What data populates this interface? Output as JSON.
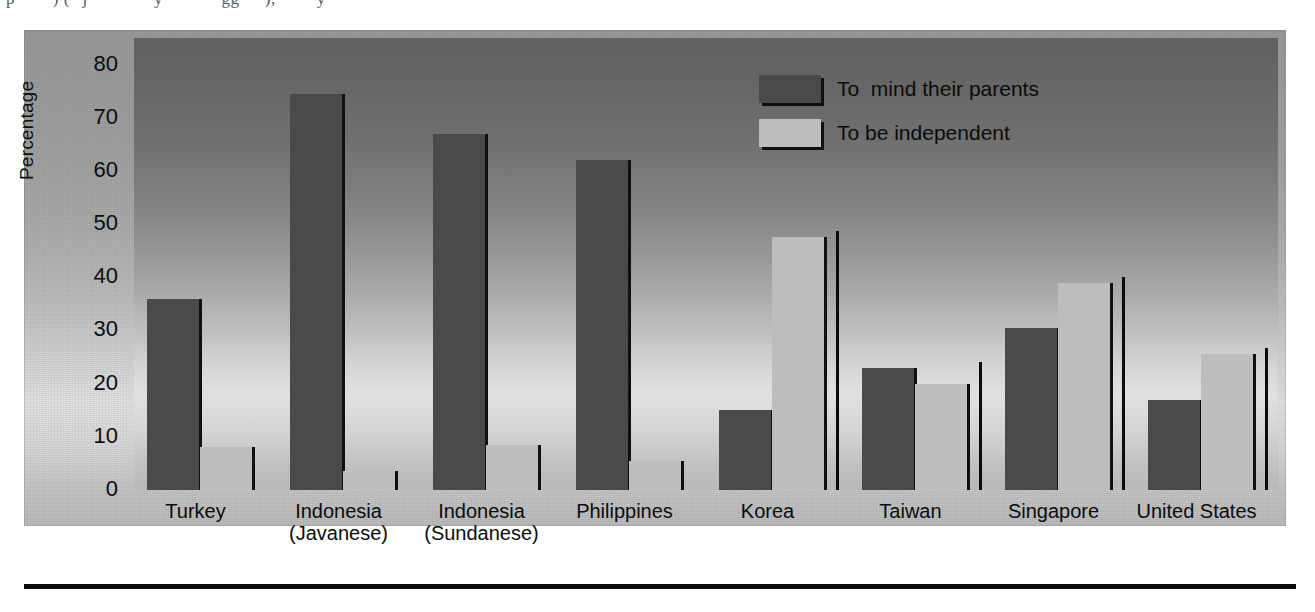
{
  "page": {
    "top_text_fragment": "p······) (··j·····  ···  ·y ···  ··· ·gg····),  ·· ···y",
    "bottom_rule": "horizontal-rule"
  },
  "chart_data": {
    "type": "bar",
    "title": "",
    "xlabel": "",
    "ylabel": "Percentage",
    "ylim": [
      0,
      85
    ],
    "yticks": [
      0,
      10,
      20,
      30,
      40,
      50,
      60,
      70,
      80
    ],
    "ytick_labels": [
      "0",
      "10",
      "20",
      "30",
      "40",
      "50",
      "60",
      "70",
      "80"
    ],
    "grid": false,
    "legend_position": "top-right",
    "categories": [
      "Turkey",
      "Indonesia\n(Javanese)",
      "Indonesia\n(Sundanese)",
      "Philippines",
      "Korea",
      "Taiwan",
      "Singapore",
      "United States"
    ],
    "series": [
      {
        "name": "To  mind their parents",
        "color": "#4a4a4a",
        "values": [
          36,
          74.5,
          67,
          62,
          15,
          23,
          30.5,
          17
        ]
      },
      {
        "name": "To be independent",
        "color": "#bdbdbd",
        "values": [
          8,
          3.5,
          8.5,
          5.5,
          47.5,
          20,
          39,
          25.5
        ]
      }
    ],
    "separators_after": [
      "Korea",
      "Taiwan",
      "Singapore",
      "United States"
    ]
  },
  "colors": {
    "series_dark": "#4a4a4a",
    "series_light": "#bdbdbd",
    "outline": "#101010",
    "panel_top": "#9a9a9a",
    "panel_bottom": "#bcbcbc",
    "plot_top": "#616161",
    "plot_bottom": "#b8b8b8",
    "text": "#0c0c0c",
    "tick_mark": "#f2f2f2"
  }
}
